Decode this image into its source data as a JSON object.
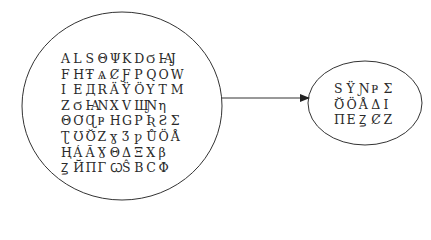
{
  "diagram": {
    "source_set": {
      "shape": "ellipse",
      "rows": [
        [
          "A",
          "L",
          "S",
          "Θ",
          "Ψ",
          "K",
          "D",
          "Ϭ",
          "Ꙗ",
          "J"
        ],
        [
          "F",
          "H",
          "Ŧ",
          "Ѧ",
          "Ȼ",
          "Ƒ",
          "P",
          "Q",
          "O",
          "W"
        ],
        [
          "I",
          "E",
          "Д",
          "R",
          "Ä",
          "Ÿ",
          "Ö",
          "Y",
          "T",
          "M"
        ],
        [
          "Z",
          "Ϭ",
          "Ꙗ",
          "N",
          "X",
          "V",
          "Ш",
          "Ɲ",
          "η"
        ],
        [
          "Θ",
          "Ơ",
          "Ɋ",
          "Ҏ",
          "H",
          "G",
          "P",
          "Ʀ",
          "Ƨ",
          "Σ"
        ],
        [
          "Ʈ",
          "Ʊ",
          "Ʊ̆",
          "Z",
          "ɣ",
          "Ʒ",
          "ƿ",
          "Ů",
          "Ö",
          "Å"
        ],
        [
          "Ⱨ",
          "Á",
          "Ã",
          "Ɣ",
          "Θ",
          "Δ",
          "Ξ",
          "X",
          "β"
        ],
        [
          "Ꙁ",
          "Й",
          "Π",
          "Γ",
          "Ꞷ",
          "Ŝ",
          "B",
          "C",
          "Φ"
        ]
      ]
    },
    "target_set": {
      "shape": "ellipse",
      "rows": [
        [
          "S",
          "Ÿ",
          "Ɲ",
          "Ҏ",
          "Σ"
        ],
        [
          "Ʊ̆",
          "Ö",
          "Å",
          "Δ",
          "I"
        ],
        [
          "Π",
          "E",
          "Ꙁ",
          "Ȼ",
          "Z"
        ]
      ]
    },
    "arrow": {
      "from": "source_set",
      "to": "target_set",
      "direction": "right"
    },
    "colors": {
      "stroke": "#222222",
      "text": "#2a2a2a",
      "background": "#ffffff"
    }
  }
}
